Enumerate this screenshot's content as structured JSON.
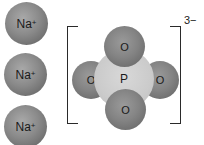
{
  "diagram": {
    "cations": [
      {
        "symbol": "Na",
        "charge": "+"
      },
      {
        "symbol": "Na",
        "charge": "+"
      },
      {
        "symbol": "Na",
        "charge": "+"
      }
    ],
    "anion": {
      "central_atom": "P",
      "oxygens": [
        "O",
        "O",
        "O",
        "O"
      ],
      "charge": "3−"
    },
    "colors": {
      "sodium": "#8a8a8a",
      "oxygen": "#848484",
      "phosphorus": "#cbcbcb",
      "bracket": "#2a2a2a"
    }
  }
}
